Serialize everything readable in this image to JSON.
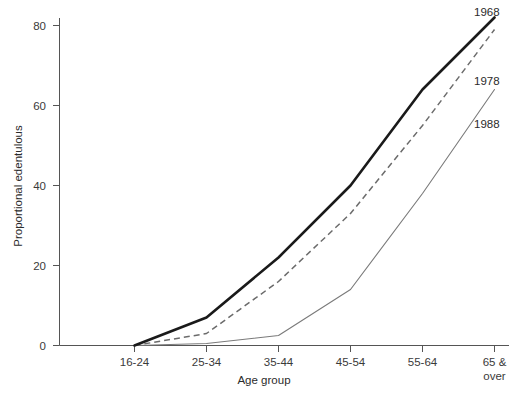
{
  "chart_data": {
    "type": "line",
    "title": "",
    "xlabel": "Age group",
    "ylabel": "Proportional edentulous",
    "categories": [
      "16-24",
      "25-34",
      "35-44",
      "45-54",
      "55-64",
      "65 &\nover"
    ],
    "category_labels": [
      {
        "line1": "16-24",
        "line2": ""
      },
      {
        "line1": "25-34",
        "line2": ""
      },
      {
        "line1": "35-44",
        "line2": ""
      },
      {
        "line1": "45-54",
        "line2": ""
      },
      {
        "line1": "55-64",
        "line2": ""
      },
      {
        "line1": "65 &",
        "line2": "over"
      }
    ],
    "ylim": [
      0,
      85
    ],
    "yticks": [
      0,
      20,
      40,
      60,
      80
    ],
    "ytick_labels": [
      "0",
      "20",
      "40",
      "60",
      "80"
    ],
    "grid": false,
    "legend_position": "right-inline-end-of-line",
    "series": [
      {
        "name": "1968",
        "style": "thick-solid",
        "color": "#1a1a1a",
        "values": [
          0,
          7,
          22,
          40,
          64,
          82
        ]
      },
      {
        "name": "1978",
        "style": "dashed",
        "color": "#6b6b6b",
        "values": [
          0,
          3,
          16,
          33,
          55,
          79
        ]
      },
      {
        "name": "1988",
        "style": "thin-solid",
        "color": "#7a7a7a",
        "values": [
          0,
          0.5,
          2.5,
          14,
          38,
          64
        ]
      }
    ]
  },
  "labels": {
    "series_1968": "1968",
    "series_1978": "1978",
    "series_1988": "1988",
    "y_axis_title": "Proportional edentulous",
    "x_axis_title": "Age group",
    "ytick_0": "0",
    "ytick_20": "20",
    "ytick_40": "40",
    "ytick_60": "60",
    "ytick_80": "80",
    "xtick_0": "16-24",
    "xtick_1": "25-34",
    "xtick_2": "35-44",
    "xtick_3": "45-54",
    "xtick_4": "55-64",
    "xtick_5a": "65 &",
    "xtick_5b": "over"
  }
}
